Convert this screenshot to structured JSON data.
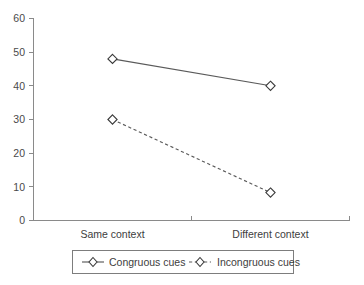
{
  "chart_data": {
    "type": "line",
    "title": "",
    "subtitle": "",
    "xlabel": "",
    "ylabel": "",
    "categories": [
      "Same context",
      "Different context"
    ],
    "xtick_labels": [
      "Same context",
      "Different context"
    ],
    "ytick_labels": [
      "0",
      "10",
      "20",
      "30",
      "40",
      "50",
      "60"
    ],
    "ytick_values": [
      0,
      10,
      20,
      30,
      40,
      50,
      60
    ],
    "ylim": [
      0,
      60
    ],
    "grid": false,
    "legend_position": "bottom",
    "series": [
      {
        "name": "Congruous cues",
        "values": [
          48,
          40
        ],
        "linestyle": "solid",
        "marker": "open-diamond",
        "color": "#5a5a5a"
      },
      {
        "name": "Incongruous cues",
        "values": [
          30,
          8.3
        ],
        "linestyle": "dashed",
        "marker": "open-diamond",
        "color": "#5a5a5a"
      }
    ],
    "legend_entries": [
      "Congruous cues",
      "Incongruous cues"
    ],
    "annotations": []
  },
  "axis": {
    "y_tick_0": "0",
    "y_tick_10": "10",
    "y_tick_20": "20",
    "y_tick_30": "30",
    "y_tick_40": "40",
    "y_tick_50": "50",
    "y_tick_60": "60",
    "x_cat_1": "Same context",
    "x_cat_2": "Different context"
  },
  "legend": {
    "entry_1": "Congruous cues",
    "entry_2": "Incongruous cues"
  }
}
